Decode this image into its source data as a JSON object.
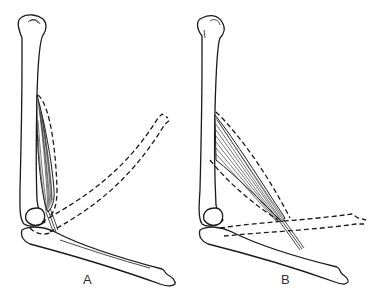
{
  "figure": {
    "panels": [
      {
        "id": "A",
        "label": "A"
      },
      {
        "id": "B",
        "label": "B"
      }
    ],
    "colors": {
      "line": "#1a1a1a",
      "background": "#ffffff",
      "label": "#333333"
    }
  }
}
